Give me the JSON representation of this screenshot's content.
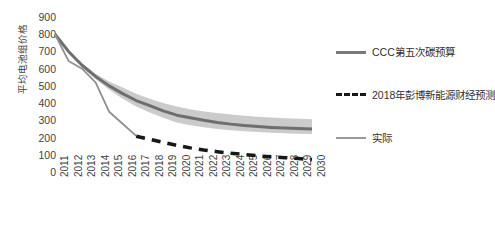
{
  "chart_data": {
    "type": "line",
    "title": "",
    "subtitle": "",
    "xlabel": "",
    "ylabel": "平均电池组价格",
    "x": [
      2011,
      2012,
      2013,
      2014,
      2015,
      2016,
      2017,
      2018,
      2019,
      2020,
      2021,
      2022,
      2023,
      2024,
      2025,
      2026,
      2027,
      2028,
      2029,
      2030
    ],
    "xtick_labels": [
      "2011",
      "2012",
      "2013",
      "2014",
      "2015",
      "2016",
      "2017",
      "2018",
      "2019",
      "2020",
      "2021",
      "2022",
      "2023",
      "2024",
      "2025",
      "2026",
      "2027",
      "2028",
      "2029",
      "2030"
    ],
    "ytick_labels": [
      "0",
      "100",
      "200",
      "300",
      "400",
      "500",
      "600",
      "700",
      "800",
      "900"
    ],
    "ytick_values": [
      0,
      100,
      200,
      300,
      400,
      500,
      600,
      700,
      800,
      900
    ],
    "ylim": [
      0,
      900
    ],
    "xlim": [
      2011,
      2030
    ],
    "grid": false,
    "legend_position": "right",
    "series": [
      {
        "name": "CCC第五次碳预算",
        "style": "solid",
        "color": "#6e6e6e",
        "width": 3,
        "values": [
          800,
          700,
          620,
          555,
          500,
          455,
          415,
          385,
          355,
          330,
          315,
          300,
          288,
          278,
          270,
          264,
          259,
          255,
          252,
          250
        ],
        "band": {
          "upper": [
            800,
            705,
            630,
            570,
            525,
            490,
            455,
            425,
            400,
            380,
            365,
            352,
            342,
            334,
            327,
            321,
            316,
            312,
            309,
            306
          ],
          "lower": [
            800,
            695,
            610,
            540,
            478,
            425,
            380,
            345,
            315,
            288,
            272,
            260,
            250,
            243,
            237,
            232,
            228,
            225,
            222,
            220
          ],
          "color": "#b9b9b9",
          "opacity": 0.75
        }
      },
      {
        "name": "2018年彭博新能源财经预测",
        "style": "dashed",
        "color": "#171717",
        "width": 3.5,
        "start_year": 2017,
        "values": [
          null,
          null,
          null,
          null,
          null,
          null,
          208,
          190,
          172,
          155,
          140,
          128,
          118,
          109,
          101,
          94,
          88,
          83,
          78,
          72
        ]
      },
      {
        "name": "实际",
        "style": "solid",
        "color": "#8f8f8f",
        "width": 1.8,
        "end_year": 2017,
        "values": [
          800,
          645,
          600,
          520,
          350,
          280,
          210,
          null,
          null,
          null,
          null,
          null,
          null,
          null,
          null,
          null,
          null,
          null,
          null,
          null
        ]
      }
    ],
    "legend": [
      {
        "label": "CCC第五次碳预算",
        "swatch": "solid-thick",
        "color": "#7a7a7a"
      },
      {
        "label": "2018年彭博新能源财经预测",
        "swatch": "dashed",
        "color": "#171717"
      },
      {
        "label": "实际",
        "swatch": "solid-thin",
        "color": "#9a9a9a"
      }
    ]
  }
}
